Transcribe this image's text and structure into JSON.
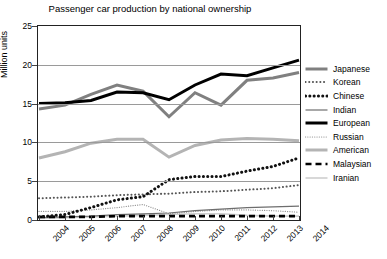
{
  "chart_data": {
    "type": "line",
    "title": "Passenger car production by national ownership",
    "xlabel": "",
    "ylabel": "Million units",
    "ylim": [
      0,
      25
    ],
    "yticks": [
      0,
      5,
      10,
      15,
      20,
      25
    ],
    "grid": "horizontal",
    "legend_position": "right",
    "categories": [
      "2004",
      "2005",
      "2006",
      "2007",
      "2008",
      "2009",
      "2010",
      "2011",
      "2012",
      "2013",
      "2014"
    ],
    "series": [
      {
        "name": "Japanese",
        "style": "thick-gray-solid",
        "color": "#808080",
        "values": [
          14.3,
          14.8,
          16.2,
          17.4,
          16.6,
          13.3,
          16.4,
          14.8,
          18.0,
          18.3,
          19.0
        ]
      },
      {
        "name": "Korean",
        "style": "fine-dotted",
        "color": "#555555",
        "values": [
          2.8,
          2.9,
          3.0,
          3.2,
          3.3,
          3.4,
          3.6,
          3.7,
          3.9,
          4.1,
          4.5
        ]
      },
      {
        "name": "Chinese",
        "style": "bold-dotted",
        "color": "#111111",
        "values": [
          0.4,
          0.7,
          1.6,
          2.6,
          3.0,
          5.2,
          5.6,
          5.6,
          6.3,
          6.9,
          8.0
        ]
      },
      {
        "name": "Indian",
        "style": "thin-gray-solid",
        "color": "#6e6e6e",
        "values": [
          0.3,
          0.4,
          0.5,
          0.7,
          0.8,
          0.9,
          1.2,
          1.4,
          1.6,
          1.7,
          1.8
        ]
      },
      {
        "name": "European",
        "style": "thick-black-solid",
        "color": "#000000",
        "values": [
          15.0,
          15.1,
          15.4,
          16.5,
          16.4,
          15.5,
          17.4,
          18.8,
          18.6,
          19.6,
          20.6
        ]
      },
      {
        "name": "Russian",
        "style": "fine-dotted-light",
        "color": "#8f8f8f",
        "values": [
          1.1,
          1.1,
          1.3,
          1.6,
          2.0,
          0.8,
          1.1,
          1.3,
          1.3,
          1.2,
          1.0
        ]
      },
      {
        "name": "American",
        "style": "thick-light-gray",
        "color": "#b4b4b4",
        "values": [
          8.0,
          8.8,
          9.9,
          10.4,
          10.4,
          8.1,
          9.6,
          10.3,
          10.5,
          10.4,
          10.2
        ]
      },
      {
        "name": "Malaysian",
        "style": "black-dashed",
        "color": "#000000",
        "values": [
          0.4,
          0.4,
          0.4,
          0.5,
          0.5,
          0.5,
          0.5,
          0.5,
          0.5,
          0.5,
          0.5
        ]
      },
      {
        "name": "Iranian",
        "style": "very-light-gray",
        "color": "#cfcfcf",
        "values": [
          0.2,
          0.3,
          0.4,
          0.5,
          0.6,
          0.7,
          0.8,
          0.8,
          0.6,
          0.5,
          0.5
        ]
      }
    ]
  },
  "axis": {
    "y_label": "Million units",
    "y_ticks": [
      "0",
      "5",
      "10",
      "15",
      "20",
      "25"
    ],
    "x_ticks": [
      "2004",
      "2005",
      "2006",
      "2007",
      "2008",
      "2009",
      "2010",
      "2011",
      "2012",
      "2013",
      "2014"
    ]
  },
  "legend": {
    "items": [
      {
        "label": "Japanese"
      },
      {
        "label": "Korean"
      },
      {
        "label": "Chinese"
      },
      {
        "label": "Indian"
      },
      {
        "label": "European"
      },
      {
        "label": "Russian"
      },
      {
        "label": "American"
      },
      {
        "label": "Malaysian"
      },
      {
        "label": "Iranian"
      }
    ]
  }
}
